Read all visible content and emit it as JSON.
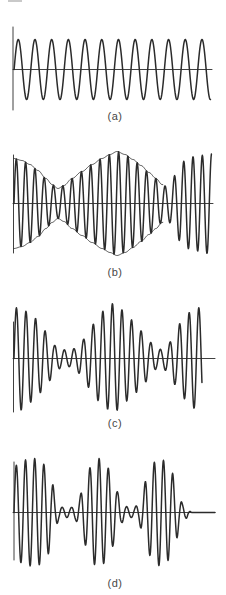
{
  "figure": {
    "colors": {
      "stroke": "#2b2b2b",
      "label": "#474747",
      "background": "#ffffff",
      "artifact": "#c9c9c9"
    },
    "panels": [
      {
        "label": "(a)",
        "axis": {
          "h_y": 69.5,
          "h_x1": 13,
          "h_x2": 212,
          "v_x": 13,
          "v_y1": 27,
          "v_y2": 110
        },
        "wave": {
          "x1": 14.1,
          "x2": 210.5,
          "period": 16.7,
          "x0": 14.1,
          "amp": 30
        }
      },
      {
        "label": "(b)",
        "axis": {
          "h_y": 203.5,
          "h_x1": 13,
          "h_x2": 213,
          "v_x": 13.5,
          "v_y1": 155,
          "v_y2": 253
        },
        "wave": {
          "x1": 14,
          "x2": 211.5,
          "period": 9.3,
          "x0": 14,
          "amp_points": [
            [
              14,
              45
            ],
            [
              22,
              43
            ],
            [
              30,
              39
            ],
            [
              38,
              33
            ],
            [
              46,
              25
            ],
            [
              52,
              19
            ],
            [
              58,
              15
            ],
            [
              64,
              18
            ],
            [
              72,
              25
            ],
            [
              82,
              32
            ],
            [
              92,
              39
            ],
            [
              102,
              45
            ],
            [
              110,
              49
            ],
            [
              117,
              52
            ],
            [
              125,
              49
            ],
            [
              133,
              44
            ],
            [
              141,
              38
            ],
            [
              149,
              31
            ],
            [
              156,
              25
            ],
            [
              162,
              19
            ],
            [
              167,
              17
            ],
            [
              171,
              20
            ],
            [
              176,
              30
            ],
            [
              181,
              40
            ],
            [
              187,
              45
            ],
            [
              194,
              47
            ],
            [
              201,
              48
            ],
            [
              208,
              50
            ]
          ],
          "envelope_end": 163
        }
      },
      {
        "label": "(c)",
        "axis": {
          "h_y": 358.5,
          "h_x1": 13,
          "h_x2": 215,
          "v_x": 13.5,
          "v_y1": 322,
          "v_y2": 412
        },
        "wave": {
          "x1": 14,
          "x2": 202,
          "period": 9.6,
          "x0": 14,
          "amp_points": [
            [
              14,
              50
            ],
            [
              20,
              52
            ],
            [
              27,
              47
            ],
            [
              34,
              41
            ],
            [
              41,
              34
            ],
            [
              48,
              24
            ],
            [
              55,
              13
            ],
            [
              62,
              9
            ],
            [
              68,
              8
            ],
            [
              75,
              10
            ],
            [
              82,
              18
            ],
            [
              90,
              30
            ],
            [
              98,
              42
            ],
            [
              106,
              50
            ],
            [
              113,
              55
            ],
            [
              120,
              50
            ],
            [
              128,
              42
            ],
            [
              136,
              34
            ],
            [
              144,
              25
            ],
            [
              151,
              16
            ],
            [
              157,
              10
            ],
            [
              162,
              9
            ],
            [
              168,
              14
            ],
            [
              175,
              26
            ],
            [
              182,
              38
            ],
            [
              189,
              46
            ],
            [
              195,
              50
            ],
            [
              201,
              51
            ]
          ]
        }
      },
      {
        "label": "(d)",
        "axis": {
          "h_y": 512.5,
          "h_x1": 13,
          "h_x2": 215,
          "v_x": 14,
          "v_y1": 462,
          "v_y2": 560
        },
        "wave": {
          "x1": 14,
          "x2": 215,
          "period": 9.2,
          "x0": 14,
          "amp_points": [
            [
              14,
              46
            ],
            [
              20,
              50
            ],
            [
              27,
              53
            ],
            [
              34,
              54
            ],
            [
              41,
              52
            ],
            [
              47,
              44
            ],
            [
              52,
              30
            ],
            [
              56,
              14
            ],
            [
              59,
              7
            ],
            [
              63,
              5
            ],
            [
              67,
              5
            ],
            [
              71,
              5
            ],
            [
              75,
              7
            ],
            [
              79,
              14
            ],
            [
              84,
              30
            ],
            [
              89,
              44
            ],
            [
              94,
              52
            ],
            [
              99,
              54
            ],
            [
              104,
              51
            ],
            [
              109,
              44
            ],
            [
              114,
              32
            ],
            [
              118,
              20
            ],
            [
              122,
              10
            ],
            [
              126,
              6
            ],
            [
              130,
              5
            ],
            [
              134,
              5
            ],
            [
              138,
              8
            ],
            [
              142,
              18
            ],
            [
              147,
              36
            ],
            [
              152,
              48
            ],
            [
              157,
              53
            ],
            [
              162,
              53
            ],
            [
              167,
              49
            ],
            [
              172,
              40
            ],
            [
              176,
              28
            ],
            [
              180,
              14
            ],
            [
              183,
              8
            ],
            [
              186,
              6
            ],
            [
              189,
              2
            ],
            [
              192,
              0
            ],
            [
              215,
              0
            ]
          ]
        }
      }
    ]
  }
}
